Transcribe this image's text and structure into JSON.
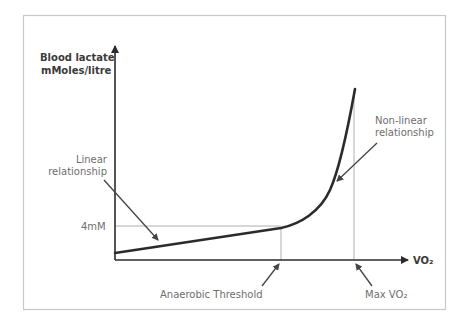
{
  "diagram": {
    "y_axis_label_line1": "Blood lactate",
    "y_axis_label_line2": "mMoles/litre",
    "x_axis_label": "VO₂",
    "y_tick_label": "4mM",
    "annotation_linear_line1": "Linear",
    "annotation_linear_line2": "relationship",
    "annotation_nonlinear_line1": "Non-linear",
    "annotation_nonlinear_line2": "relationship",
    "marker_anaerobic_threshold": "Anaerobic Threshold",
    "marker_max_vo2": "Max VO₂",
    "colors": {
      "curve": "#2b2b2b",
      "axis": "#2b2b2b",
      "guide": "#9a9a9a",
      "frame": "#c8c8c8",
      "label": "#6e6e6e"
    }
  }
}
